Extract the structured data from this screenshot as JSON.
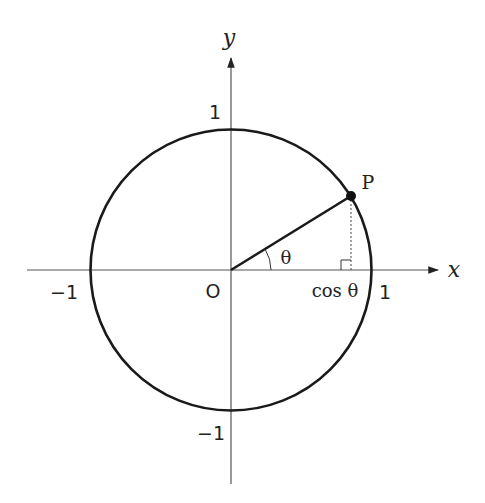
{
  "diagram": {
    "axes": {
      "x_label": "x",
      "y_label": "y",
      "origin_label": "O"
    },
    "ticks": {
      "x_pos": "1",
      "x_neg": "−1",
      "y_pos": "1",
      "y_neg": "−1"
    },
    "point": {
      "label": "P"
    },
    "angle": {
      "label": "θ"
    },
    "projection": {
      "label": "cos θ"
    },
    "colors": {
      "stroke": "#1a1a1a",
      "axis": "#555555",
      "background": "#ffffff"
    }
  }
}
